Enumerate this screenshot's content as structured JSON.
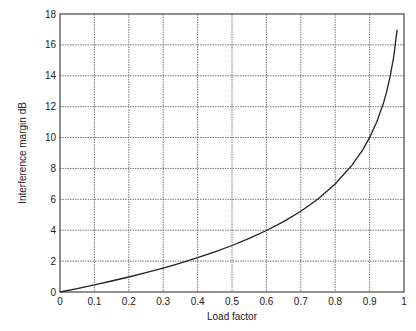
{
  "chart_data": {
    "type": "line",
    "title": "",
    "xlabel": "Load factor",
    "ylabel": "Interference margin dB",
    "xlim": [
      0,
      1
    ],
    "ylim": [
      0,
      18
    ],
    "xticks": [
      0,
      0.1,
      0.2,
      0.3,
      0.4,
      0.5,
      0.6,
      0.7,
      0.8,
      0.9,
      1
    ],
    "xtick_labels": [
      "0",
      "0.1",
      "0.2",
      "0.3",
      "0.4",
      "0.5",
      "0.6",
      "0.7",
      "0.8",
      "0.9",
      "1"
    ],
    "yticks": [
      0,
      2,
      4,
      6,
      8,
      10,
      12,
      14,
      16,
      18
    ],
    "ytick_labels": [
      "0",
      "2",
      "4",
      "6",
      "8",
      "10",
      "12",
      "14",
      "16",
      "18"
    ],
    "grid": true,
    "legend": null,
    "series": [
      {
        "name": "Interference margin",
        "color": "#222222",
        "x": [
          0,
          0.05,
          0.1,
          0.15,
          0.2,
          0.25,
          0.3,
          0.35,
          0.4,
          0.45,
          0.5,
          0.55,
          0.6,
          0.65,
          0.7,
          0.75,
          0.8,
          0.85,
          0.88,
          0.9,
          0.92,
          0.94,
          0.95,
          0.96,
          0.97,
          0.98
        ],
        "y": [
          0,
          0.22,
          0.46,
          0.71,
          0.97,
          1.25,
          1.55,
          1.87,
          2.22,
          2.6,
          3.01,
          3.47,
          3.98,
          4.56,
          5.23,
          6.02,
          6.99,
          8.24,
          9.21,
          10.0,
          10.97,
          12.22,
          13.01,
          13.98,
          15.23,
          16.99
        ]
      }
    ]
  }
}
